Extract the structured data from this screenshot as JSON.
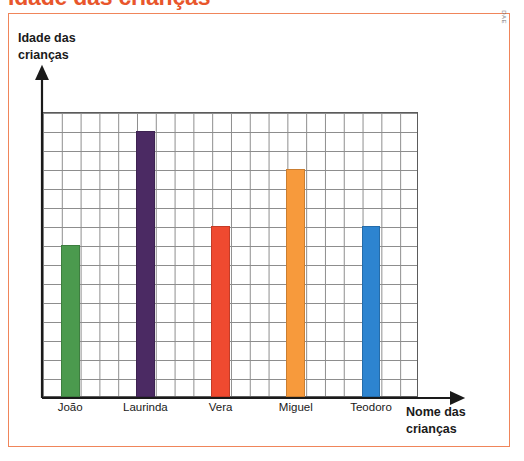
{
  "title": "Idade das crianças",
  "credit": "DAE",
  "axis": {
    "y_title": "Idade das\ncrianças",
    "x_title": "Nome das\ncrianças"
  },
  "colors": {
    "frame_border": "#f0855a",
    "title": "#e8562c",
    "grid_line": "#8d8d8d",
    "axis_line": "#1a1a1a"
  },
  "chart_data": {
    "type": "bar",
    "title": "Idade das crianças",
    "xlabel": "Nome das crianças",
    "ylabel": "Idade das crianças",
    "categories": [
      "João",
      "Laurinda",
      "Vera",
      "Miguel",
      "Teodoro"
    ],
    "values": [
      8,
      14,
      9,
      12,
      9
    ],
    "ylim": [
      0,
      15
    ],
    "grid": true,
    "grid_rows": 15,
    "grid_cols": 20,
    "legend": "none",
    "bars": [
      {
        "label": "João",
        "value": 8,
        "color": "#4b9a4e",
        "col": 2
      },
      {
        "label": "Laurinda",
        "value": 14,
        "color": "#4b2a63",
        "col": 6
      },
      {
        "label": "Vera",
        "value": 9,
        "color": "#ef4a30",
        "col": 10
      },
      {
        "label": "Miguel",
        "value": 12,
        "color": "#f79a3c",
        "col": 14
      },
      {
        "label": "Teodoro",
        "value": 9,
        "color": "#2d84d0",
        "col": 18
      }
    ]
  }
}
